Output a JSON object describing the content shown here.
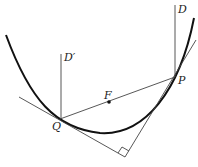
{
  "diagram": {
    "type": "geometry",
    "labels": {
      "P": "P",
      "Q": "Q",
      "F": "F",
      "D": "D",
      "D_prime": "D′"
    },
    "points": {
      "P": [
        174,
        77
      ],
      "Q": [
        60,
        119
      ],
      "F": [
        109,
        102
      ],
      "right_angle_vertex": [
        125,
        157
      ]
    },
    "colors": {
      "curve": "#111111",
      "lines": "#444444",
      "background": "#ffffff"
    }
  }
}
